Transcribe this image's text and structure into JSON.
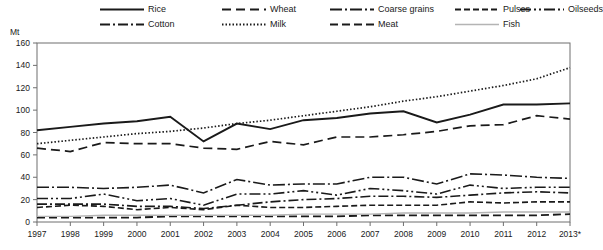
{
  "axis_unit_label": "Mt",
  "legend": {
    "rows": [
      [
        {
          "label": "Rice",
          "key": "rice"
        },
        {
          "label": "Wheat",
          "key": "wheat"
        },
        {
          "label": "Coarse grains",
          "key": "coarse_grains"
        },
        {
          "label": "Pulses",
          "key": "pulses"
        },
        {
          "label": "Oilseeds",
          "key": "oilseeds"
        }
      ],
      [
        {
          "label": "Cotton",
          "key": "cotton"
        },
        {
          "label": "Milk",
          "key": "milk"
        },
        {
          "label": "Meat",
          "key": "meat"
        },
        {
          "label": "Fish",
          "key": "fish"
        }
      ]
    ]
  },
  "chart_data": {
    "type": "line",
    "title": "",
    "xlabel": "",
    "ylabel": "Mt",
    "ylim": [
      0,
      160
    ],
    "yticks": [
      0,
      20,
      40,
      60,
      80,
      100,
      120,
      140,
      160
    ],
    "grid": false,
    "legend_position": "top",
    "categories": [
      "1997",
      "1998",
      "1999",
      "2000",
      "2001",
      "2002",
      "2003",
      "2004",
      "2005",
      "2006",
      "2007",
      "2008",
      "2009",
      "2010",
      "2011",
      "2012",
      "2013*"
    ],
    "series": [
      {
        "name": "Rice",
        "key": "rice",
        "color": "#1a1a1a",
        "width": 1.9,
        "dash": "none",
        "values": [
          82,
          85,
          88,
          90,
          94,
          72,
          88,
          83,
          91,
          93,
          97,
          99,
          89,
          96,
          105,
          105,
          106
        ]
      },
      {
        "name": "Wheat",
        "key": "wheat",
        "color": "#1a1a1a",
        "width": 1.7,
        "dash": "9,5",
        "values": [
          66,
          63,
          71,
          70,
          70,
          66,
          65,
          72,
          69,
          76,
          76,
          78,
          81,
          86,
          87,
          95,
          92
        ]
      },
      {
        "name": "Coarse grains",
        "key": "coarse_grains",
        "color": "#1a1a1a",
        "width": 1.6,
        "dash": "12,3,2,3",
        "values": [
          31,
          31,
          30,
          31,
          33,
          26,
          38,
          33,
          34,
          34,
          40,
          40,
          34,
          43,
          42,
          40,
          39
        ]
      },
      {
        "name": "Pulses",
        "key": "pulses",
        "color": "#1a1a1a",
        "width": 1.6,
        "dash": "6,3",
        "values": [
          13,
          15,
          14,
          11,
          13,
          11,
          15,
          13,
          13,
          14,
          15,
          15,
          15,
          18,
          17,
          18,
          18
        ]
      },
      {
        "name": "Oilseeds",
        "key": "oilseeds",
        "color": "#1a1a1a",
        "width": 1.6,
        "dash": "11,3,2,3,2,3",
        "values": [
          21,
          21,
          25,
          19,
          21,
          15,
          25,
          25,
          28,
          24,
          30,
          28,
          25,
          33,
          30,
          31,
          31
        ]
      },
      {
        "name": "Cotton",
        "key": "cotton",
        "color": "#1a1a1a",
        "width": 1.6,
        "dash": "10,3,2,3",
        "values": [
          16,
          16,
          16,
          14,
          14,
          12,
          15,
          18,
          20,
          21,
          23,
          23,
          22,
          24,
          26,
          27,
          26
        ]
      },
      {
        "name": "Milk",
        "key": "milk",
        "color": "#1a1a1a",
        "width": 1.7,
        "dash": "1.5,2",
        "values": [
          70,
          73,
          76,
          79,
          81,
          84,
          88,
          91,
          95,
          99,
          103,
          108,
          112,
          117,
          122,
          128,
          138
        ]
      },
      {
        "name": "Meat",
        "key": "meat",
        "color": "#1a1a1a",
        "width": 1.8,
        "dash": "8,4",
        "values": [
          4,
          4,
          4,
          4,
          5,
          5,
          5,
          5,
          5,
          5,
          6,
          6,
          6,
          6,
          6,
          6,
          7
        ]
      },
      {
        "name": "Fish",
        "key": "fish",
        "color": "#b4b4b4",
        "width": 1.4,
        "dash": "none",
        "values": [
          5,
          5,
          6,
          6,
          6,
          6,
          6,
          6,
          7,
          7,
          7,
          8,
          8,
          8,
          9,
          9,
          9
        ]
      }
    ]
  }
}
